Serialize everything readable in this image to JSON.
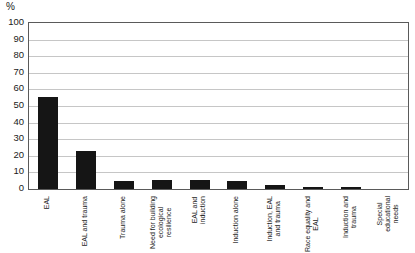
{
  "chart_data": {
    "type": "bar",
    "title": "",
    "xlabel": "",
    "ylabel": "%",
    "ylim": [
      0,
      100
    ],
    "grid": true,
    "legend": false,
    "yticks": [
      0,
      10,
      20,
      30,
      40,
      50,
      60,
      70,
      80,
      90,
      100
    ],
    "categories": [
      "EAL",
      "EAL and trauma",
      "Trauma alone",
      "Need for building ecological resilience",
      "EAL and induction",
      "Induction alone",
      "Induction, EAL and trauma",
      "Race equality and EAL",
      "Induction and trauma",
      "Special educational needs"
    ],
    "category_lines": [
      [
        "EAL"
      ],
      [
        "EAL and trauma"
      ],
      [
        "Trauma alone"
      ],
      [
        "Need for building",
        "ecological",
        "resilience"
      ],
      [
        "EAL and",
        "induction"
      ],
      [
        "Induction alone"
      ],
      [
        "Induction, EAL",
        "and trauma"
      ],
      [
        "Race equality and",
        "EAL"
      ],
      [
        "Induction and",
        "trauma"
      ],
      [
        "Special",
        "educational",
        "needs"
      ]
    ],
    "values": [
      55.5,
      23,
      5,
      5.5,
      5.5,
      5,
      2.5,
      1.5,
      1.5,
      0
    ],
    "bar_color": "#151515",
    "gridline_color": "#c6c6c6",
    "axis_color": "#5a5a5a"
  }
}
